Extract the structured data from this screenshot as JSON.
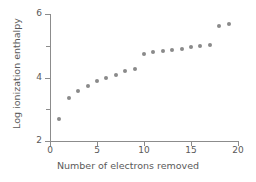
{
  "chart_data": {
    "type": "scatter",
    "title": "",
    "xlabel": "Number of electrons removed",
    "ylabel": "Log ionization enthalpy",
    "xlim": [
      0,
      20
    ],
    "ylim": [
      2,
      6
    ],
    "xticks": [
      0,
      5,
      10,
      15,
      20
    ],
    "yticks": [
      2,
      4,
      6
    ],
    "yticks_minor": [
      3,
      5
    ],
    "grid": false,
    "legend": null,
    "marker_color": "#8a8a8a",
    "axis_color": "#8c8c8c",
    "text_color": "#5a5a5a",
    "x": [
      1,
      2,
      3,
      4,
      5,
      6,
      7,
      8,
      9,
      10,
      11,
      12,
      13,
      14,
      15,
      16,
      17,
      18,
      19
    ],
    "y": [
      2.69,
      3.37,
      3.58,
      3.73,
      3.88,
      3.99,
      4.09,
      4.21,
      4.28,
      4.73,
      4.79,
      4.83,
      4.86,
      4.9,
      4.95,
      4.98,
      5.02,
      5.62,
      5.67
    ],
    "points": [
      {
        "x": 1,
        "y": 2.69
      },
      {
        "x": 2,
        "y": 3.37
      },
      {
        "x": 3,
        "y": 3.58
      },
      {
        "x": 4,
        "y": 3.73
      },
      {
        "x": 5,
        "y": 3.88
      },
      {
        "x": 6,
        "y": 3.99
      },
      {
        "x": 7,
        "y": 4.09
      },
      {
        "x": 8,
        "y": 4.21
      },
      {
        "x": 9,
        "y": 4.28
      },
      {
        "x": 10,
        "y": 4.73
      },
      {
        "x": 11,
        "y": 4.79
      },
      {
        "x": 12,
        "y": 4.83
      },
      {
        "x": 13,
        "y": 4.86
      },
      {
        "x": 14,
        "y": 4.9
      },
      {
        "x": 15,
        "y": 4.95
      },
      {
        "x": 16,
        "y": 4.98
      },
      {
        "x": 17,
        "y": 5.02
      },
      {
        "x": 18,
        "y": 5.62
      },
      {
        "x": 19,
        "y": 5.67
      }
    ]
  },
  "axes": {
    "x_tick_labels": [
      "0",
      "5",
      "10",
      "15",
      "20"
    ],
    "y_tick_labels": [
      "2",
      "4",
      "6"
    ],
    "x_title": "Number of electrons removed",
    "y_title": "Log ionization enthalpy"
  }
}
